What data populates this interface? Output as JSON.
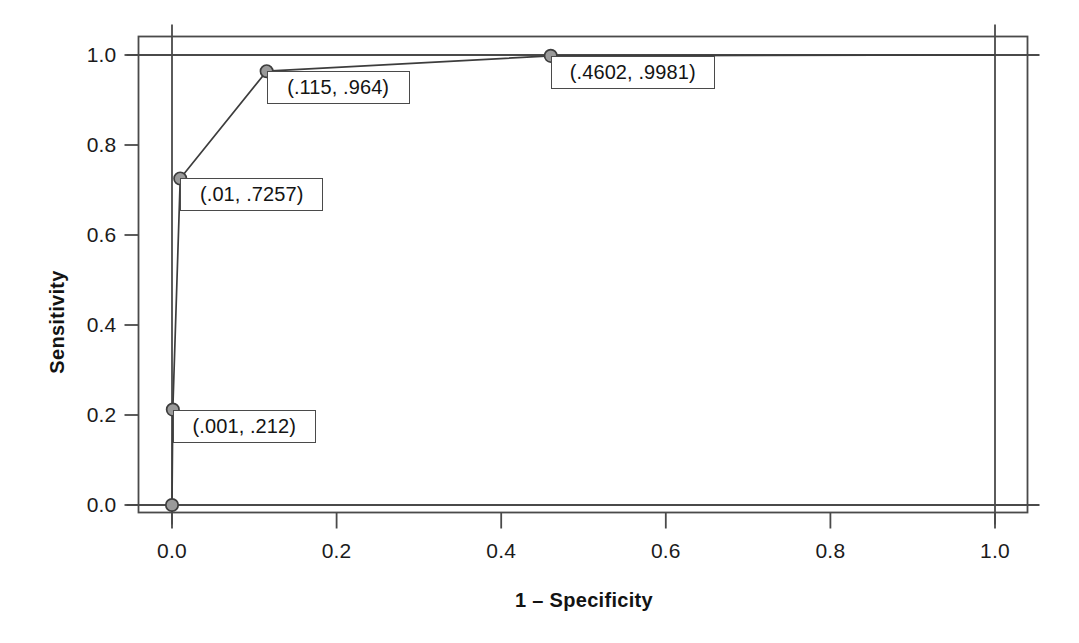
{
  "chart_data": {
    "type": "line",
    "title": "",
    "subtitle": "",
    "xlabel": "1 – Specificity",
    "ylabel": "Sensitivity",
    "xlim": [
      0.0,
      1.0
    ],
    "ylim": [
      0.0,
      1.0
    ],
    "grid": false,
    "legend": "none",
    "xticks": [
      "0.0",
      "0.2",
      "0.4",
      "0.6",
      "0.8",
      "1.0"
    ],
    "xtick_values": [
      0.0,
      0.2,
      0.4,
      0.6,
      0.8,
      1.0
    ],
    "yticks": [
      "0.0",
      "0.2",
      "0.4",
      "0.6",
      "0.8",
      "1.0"
    ],
    "ytick_values": [
      0.0,
      0.2,
      0.4,
      0.6,
      0.8,
      1.0
    ],
    "series": [
      {
        "name": "ROC curve",
        "x": [
          0.0,
          0.001,
          0.01,
          0.115,
          0.4602,
          1.0
        ],
        "y": [
          0.0,
          0.212,
          0.7257,
          0.964,
          0.9981,
          1.0
        ],
        "line_color": "#3d3d3d",
        "marker_fill": "#9a9a9a",
        "marker_edge": "#3d3d3d"
      }
    ],
    "annotations": [
      {
        "text": "(.001, .212)",
        "x": 0.001,
        "y": 0.212,
        "anchor": "below-right"
      },
      {
        "text": "(.01, .7257)",
        "x": 0.01,
        "y": 0.7257,
        "anchor": "below-right"
      },
      {
        "text": "(.115, .964)",
        "x": 0.115,
        "y": 0.964,
        "anchor": "below-right"
      },
      {
        "text": "(.4602, .9981)",
        "x": 0.4602,
        "y": 0.9981,
        "anchor": "below-right"
      }
    ],
    "reference_lines": {
      "x_axis_line_at": 0.0,
      "x_max_line_at": 1.0,
      "y_axis_line_at": 0.0,
      "y_max_line_at": 1.0
    },
    "frame": "outer-box",
    "colors": {
      "background": "#ffffff",
      "axis": "#4a4a4a",
      "text": "#141414",
      "marker_fill": "#9a9a9a"
    }
  }
}
